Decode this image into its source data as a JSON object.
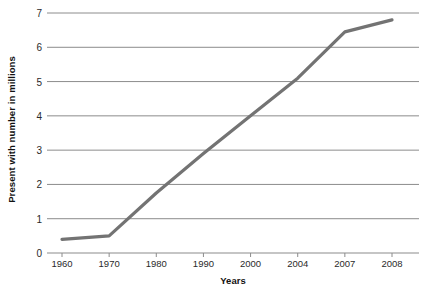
{
  "chart_data": {
    "type": "line",
    "title": "",
    "xlabel": "Years",
    "ylabel": "Present with number in millions",
    "categories": [
      "1960",
      "1970",
      "1980",
      "1990",
      "2000",
      "2004",
      "2007",
      "2008"
    ],
    "values": [
      0.4,
      0.5,
      1.75,
      2.9,
      4.0,
      5.1,
      6.45,
      6.8
    ],
    "series": [
      {
        "name": "Present with number in millions",
        "values": [
          0.4,
          0.5,
          1.75,
          2.9,
          4.0,
          5.1,
          6.45,
          6.8
        ],
        "color": "#737373"
      }
    ],
    "ylim": [
      0,
      7
    ],
    "y_ticks": [
      0,
      1,
      2,
      3,
      4,
      5,
      6,
      7
    ],
    "y_tick_labels": [
      "0",
      "1",
      "2",
      "3",
      "4",
      "5",
      "6",
      "7"
    ],
    "grid": true,
    "grid_axis": "y",
    "grid_color": "#8c8c8c",
    "legend": false,
    "legend_position": "none",
    "line_width": 3.2,
    "background": "#ffffff"
  },
  "axes": {
    "y_title": "Present with number in millions",
    "x_title": "Years"
  }
}
